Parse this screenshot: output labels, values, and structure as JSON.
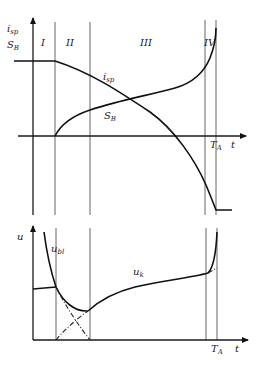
{
  "upper_chart": {
    "y_axis_label_1": "i",
    "y_axis_label_1_sub": "sp",
    "y_axis_label_2": "S",
    "y_axis_label_2_sub": "B",
    "x_axis_label": "t",
    "tick_label": "T",
    "tick_label_sub": "A",
    "regions": [
      "I",
      "II",
      "III",
      "IV"
    ],
    "curves": [
      {
        "name": "i",
        "sub": "sp"
      },
      {
        "name": "S",
        "sub": "B"
      }
    ]
  },
  "lower_chart": {
    "y_axis_label": "u",
    "x_axis_label": "t",
    "tick_label": "T",
    "tick_label_sub": "A",
    "curves": [
      {
        "name": "u",
        "sub": "bl"
      },
      {
        "name": "u",
        "sub": "k"
      }
    ]
  },
  "colors": {
    "ink": "#111111",
    "background": "#ffffff"
  }
}
